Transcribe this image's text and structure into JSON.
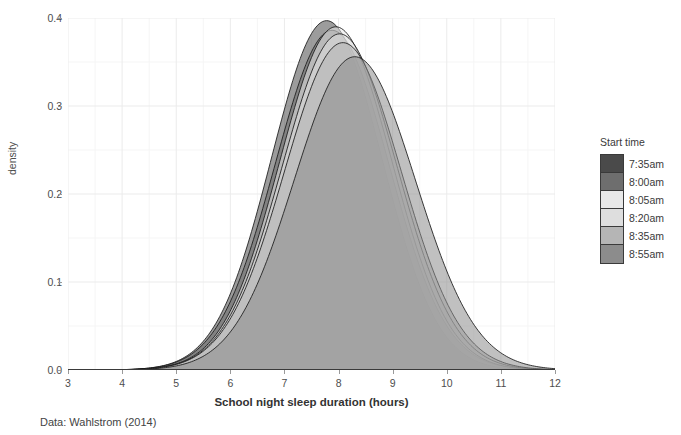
{
  "chart_data": {
    "type": "area",
    "title": "",
    "xlabel": "School night sleep duration (hours)",
    "ylabel": "density",
    "caption": "Data: Wahlstrom (2014)",
    "xlim": [
      3,
      12
    ],
    "ylim": [
      0.0,
      0.4
    ],
    "xticks": [
      3,
      4,
      5,
      6,
      7,
      8,
      9,
      10,
      11,
      12
    ],
    "yticks": [
      "0.0",
      "0.1",
      "0.2",
      "0.3",
      "0.4"
    ],
    "ytick_values": [
      0.0,
      0.1,
      0.2,
      0.3,
      0.4
    ],
    "grid": true,
    "grid_minor": true,
    "legend_position": "right",
    "legend_title": "Start time",
    "series": [
      {
        "name": "7:35am",
        "color": "#4a4a4a",
        "mean": 7.78,
        "sd": 1.02,
        "peak_density": 0.397,
        "values": [
          0.0,
          0.001,
          0.003,
          0.01,
          0.027,
          0.062,
          0.121,
          0.2,
          0.285,
          0.352,
          0.385,
          0.382,
          0.34,
          0.27,
          0.192,
          0.12,
          0.066,
          0.032,
          0.014,
          0.005,
          0.002,
          0.001,
          0.0
        ],
        "x": [
          3.0,
          3.4,
          3.8,
          4.2,
          4.6,
          5.0,
          5.4,
          5.8,
          6.2,
          6.6,
          7.0,
          7.4,
          7.8,
          8.2,
          8.6,
          9.0,
          9.4,
          9.8,
          10.2,
          10.6,
          11.0,
          11.4,
          12.0
        ]
      },
      {
        "name": "8:00am",
        "color": "#6e6e6e",
        "mean": 7.88,
        "sd": 1.05,
        "peak_density": 0.386,
        "values": [
          0.0,
          0.001,
          0.003,
          0.009,
          0.024,
          0.055,
          0.108,
          0.183,
          0.268,
          0.338,
          0.378,
          0.381,
          0.345,
          0.28,
          0.203,
          0.13,
          0.074,
          0.037,
          0.016,
          0.006,
          0.002,
          0.001,
          0.0
        ],
        "x": [
          3.0,
          3.4,
          3.8,
          4.2,
          4.6,
          5.0,
          5.4,
          5.8,
          6.2,
          6.6,
          7.0,
          7.4,
          7.8,
          8.2,
          8.6,
          9.0,
          9.4,
          9.8,
          10.2,
          10.6,
          11.0,
          11.4,
          12.0
        ]
      },
      {
        "name": "8:05am",
        "color": "#e8e8e8",
        "mean": 7.95,
        "sd": 1.04,
        "peak_density": 0.39,
        "values": [
          0.0,
          0.001,
          0.002,
          0.008,
          0.022,
          0.051,
          0.102,
          0.176,
          0.262,
          0.335,
          0.379,
          0.385,
          0.352,
          0.288,
          0.211,
          0.137,
          0.079,
          0.04,
          0.018,
          0.007,
          0.002,
          0.001,
          0.0
        ],
        "x": [
          3.0,
          3.4,
          3.8,
          4.2,
          4.6,
          5.0,
          5.4,
          5.8,
          6.2,
          6.6,
          7.0,
          7.4,
          7.8,
          8.2,
          8.6,
          9.0,
          9.4,
          9.8,
          10.2,
          10.6,
          11.0,
          11.4,
          12.0
        ]
      },
      {
        "name": "8:20am",
        "color": "#dedede",
        "mean": 8.02,
        "sd": 1.06,
        "peak_density": 0.382,
        "values": [
          0.0,
          0.001,
          0.002,
          0.007,
          0.02,
          0.047,
          0.095,
          0.166,
          0.25,
          0.323,
          0.37,
          0.38,
          0.352,
          0.292,
          0.218,
          0.144,
          0.085,
          0.044,
          0.02,
          0.008,
          0.003,
          0.001,
          0.0
        ],
        "x": [
          3.0,
          3.4,
          3.8,
          4.2,
          4.6,
          5.0,
          5.4,
          5.8,
          6.2,
          6.6,
          7.0,
          7.4,
          7.8,
          8.2,
          8.6,
          9.0,
          9.4,
          9.8,
          10.2,
          10.6,
          11.0,
          11.4,
          12.0
        ]
      },
      {
        "name": "8:35am",
        "color": "#b5b5b5",
        "mean": 8.08,
        "sd": 1.08,
        "peak_density": 0.372,
        "values": [
          0.0,
          0.001,
          0.002,
          0.007,
          0.019,
          0.044,
          0.089,
          0.157,
          0.239,
          0.312,
          0.361,
          0.374,
          0.35,
          0.294,
          0.223,
          0.15,
          0.091,
          0.048,
          0.022,
          0.009,
          0.003,
          0.001,
          0.0
        ],
        "x": [
          3.0,
          3.4,
          3.8,
          4.2,
          4.6,
          5.0,
          5.4,
          5.8,
          6.2,
          6.6,
          7.0,
          7.4,
          7.8,
          8.2,
          8.6,
          9.0,
          9.4,
          9.8,
          10.2,
          10.6,
          11.0,
          11.4,
          12.0
        ]
      },
      {
        "name": "8:55am",
        "color": "#8c8c8c",
        "mean": 8.3,
        "sd": 1.12,
        "peak_density": 0.356,
        "values": [
          0.0,
          0.0,
          0.001,
          0.004,
          0.012,
          0.03,
          0.065,
          0.12,
          0.192,
          0.265,
          0.322,
          0.352,
          0.348,
          0.31,
          0.249,
          0.179,
          0.116,
          0.066,
          0.033,
          0.014,
          0.005,
          0.002,
          0.0
        ],
        "x": [
          3.0,
          3.4,
          3.8,
          4.2,
          4.6,
          5.0,
          5.4,
          5.8,
          6.2,
          6.6,
          7.0,
          7.4,
          7.8,
          8.2,
          8.6,
          9.0,
          9.4,
          9.8,
          10.2,
          10.6,
          11.0,
          11.4,
          12.0
        ]
      }
    ]
  },
  "legend": {
    "title": "Start time",
    "items": [
      {
        "label": "7:35am",
        "color": "#4a4a4a"
      },
      {
        "label": "8:00am",
        "color": "#6e6e6e"
      },
      {
        "label": "8:05am",
        "color": "#e8e8e8"
      },
      {
        "label": "8:20am",
        "color": "#dedede"
      },
      {
        "label": "8:35am",
        "color": "#b5b5b5"
      },
      {
        "label": "8:55am",
        "color": "#8c8c8c"
      }
    ]
  },
  "theme": {
    "panel_background": "#ffffff",
    "grid_major": "#ebebeb",
    "grid_minor": "#f5f5f5",
    "axis_text": "#4d4d4d",
    "axis_line": "#9a9a9a",
    "curve_outline": "#1a1a1a"
  }
}
